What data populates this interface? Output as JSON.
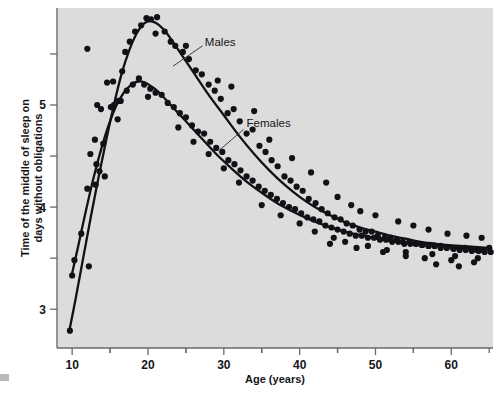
{
  "chart_data": {
    "type": "scatter",
    "title": "",
    "subtitle": "",
    "xlabel": "Age (years)",
    "ylabel": "Time of the middle of sleep on days without obligations",
    "xlim": [
      8,
      65.5
    ],
    "ylim": [
      2.62,
      5.95
    ],
    "grid": false,
    "legend_position": "inline-annotation",
    "x_ticks_major": [
      10,
      20,
      30,
      40,
      50,
      60
    ],
    "x_tick_labels": [
      "10",
      "20",
      "30",
      "40",
      "50",
      "60"
    ],
    "x_ticks_minor": [
      15,
      25,
      35,
      45,
      55,
      65
    ],
    "y_ticks_major": [
      3,
      4,
      5
    ],
    "y_tick_labels": [
      "3",
      "4",
      "5"
    ],
    "y_ticks_minor": [
      3.5,
      4.5,
      5.5
    ],
    "annotations": [
      {
        "text": "Males",
        "x": 27.5,
        "y": 5.62
      },
      {
        "text": "Females",
        "x": 33.0,
        "y": 4.82
      }
    ],
    "series": [
      {
        "name": "Males",
        "color": "#111216",
        "fit_curve": [
          [
            9.6,
            2.78
          ],
          [
            10.5,
            3.12
          ],
          [
            11.5,
            3.52
          ],
          [
            12.5,
            3.92
          ],
          [
            13.5,
            4.3
          ],
          [
            14.5,
            4.66
          ],
          [
            15.5,
            5.0
          ],
          [
            16.5,
            5.3
          ],
          [
            17.5,
            5.53
          ],
          [
            18.5,
            5.7
          ],
          [
            19.5,
            5.8
          ],
          [
            20.5,
            5.82
          ],
          [
            21.5,
            5.78
          ],
          [
            22.5,
            5.7
          ],
          [
            24.0,
            5.54
          ],
          [
            26.0,
            5.32
          ],
          [
            28.0,
            5.1
          ],
          [
            30.0,
            4.9
          ],
          [
            32.0,
            4.7
          ],
          [
            34.0,
            4.52
          ],
          [
            36.0,
            4.36
          ],
          [
            38.0,
            4.22
          ],
          [
            40.0,
            4.1
          ],
          [
            42.0,
            4.0
          ],
          [
            44.0,
            3.92
          ],
          [
            46.0,
            3.85
          ],
          [
            48.0,
            3.8
          ],
          [
            50.0,
            3.76
          ],
          [
            52.0,
            3.72
          ],
          [
            54.0,
            3.69
          ],
          [
            56.0,
            3.66
          ],
          [
            58.0,
            3.64
          ],
          [
            60.0,
            3.62
          ],
          [
            62.0,
            3.6
          ],
          [
            64.5,
            3.59
          ]
        ],
        "points": [
          [
            9.7,
            2.79
          ],
          [
            10.3,
            3.48
          ],
          [
            12.2,
            3.42
          ],
          [
            13.1,
            4.22
          ],
          [
            13.6,
            4.35
          ],
          [
            14.1,
            4.62
          ],
          [
            14.3,
            4.3
          ],
          [
            15.1,
            4.98
          ],
          [
            15.4,
            5.23
          ],
          [
            16.1,
            5.04
          ],
          [
            16.6,
            5.33
          ],
          [
            17.0,
            5.52
          ],
          [
            17.6,
            5.62
          ],
          [
            18.3,
            5.72
          ],
          [
            19.1,
            5.78
          ],
          [
            19.8,
            5.85
          ],
          [
            20.4,
            5.84
          ],
          [
            21.2,
            5.86
          ],
          [
            21.0,
            5.7
          ],
          [
            22.2,
            5.72
          ],
          [
            23.0,
            5.62
          ],
          [
            23.6,
            5.58
          ],
          [
            24.6,
            5.52
          ],
          [
            25.4,
            5.45
          ],
          [
            26.3,
            5.34
          ],
          [
            27.1,
            5.3
          ],
          [
            28.0,
            5.2
          ],
          [
            28.8,
            5.14
          ],
          [
            29.6,
            5.06
          ],
          [
            30.5,
            4.92
          ],
          [
            31.3,
            4.96
          ],
          [
            32.1,
            4.84
          ],
          [
            33.0,
            4.72
          ],
          [
            33.8,
            4.76
          ],
          [
            34.7,
            4.6
          ],
          [
            35.5,
            4.54
          ],
          [
            36.3,
            4.46
          ],
          [
            37.1,
            4.4
          ],
          [
            38.0,
            4.3
          ],
          [
            38.8,
            4.26
          ],
          [
            39.6,
            4.2
          ],
          [
            40.4,
            4.16
          ],
          [
            41.2,
            4.08
          ],
          [
            42.1,
            4.04
          ],
          [
            42.9,
            3.98
          ],
          [
            43.7,
            3.94
          ],
          [
            44.6,
            3.9
          ],
          [
            45.4,
            3.88
          ],
          [
            46.2,
            3.84
          ],
          [
            47.0,
            3.82
          ],
          [
            47.9,
            3.78
          ],
          [
            48.7,
            3.76
          ],
          [
            49.5,
            3.76
          ],
          [
            50.3,
            3.72
          ],
          [
            51.2,
            3.7
          ],
          [
            52.0,
            3.7
          ],
          [
            52.8,
            3.68
          ],
          [
            53.6,
            3.66
          ],
          [
            54.5,
            3.66
          ],
          [
            55.3,
            3.64
          ],
          [
            56.1,
            3.63
          ],
          [
            57.0,
            3.62
          ],
          [
            57.8,
            3.62
          ],
          [
            58.6,
            3.6
          ],
          [
            59.4,
            3.6
          ],
          [
            60.3,
            3.59
          ],
          [
            61.1,
            3.58
          ],
          [
            61.9,
            3.58
          ],
          [
            62.7,
            3.57
          ],
          [
            63.6,
            3.57
          ],
          [
            64.4,
            3.56
          ],
          [
            12.0,
            5.55
          ],
          [
            13.3,
            5.0
          ],
          [
            25.0,
            5.58
          ],
          [
            29.2,
            5.24
          ],
          [
            31.0,
            5.18
          ],
          [
            34.0,
            4.94
          ],
          [
            36.0,
            4.66
          ],
          [
            39.0,
            4.48
          ],
          [
            41.5,
            4.34
          ],
          [
            43.5,
            4.24
          ],
          [
            45.0,
            4.1
          ],
          [
            46.8,
            4.02
          ],
          [
            48.0,
            3.96
          ],
          [
            50.0,
            3.92
          ],
          [
            53.0,
            3.86
          ],
          [
            55.0,
            3.82
          ],
          [
            57.0,
            3.78
          ],
          [
            59.5,
            3.74
          ],
          [
            62.0,
            3.72
          ],
          [
            64.0,
            3.7
          ],
          [
            44.0,
            3.64
          ],
          [
            47.5,
            3.6
          ],
          [
            51.0,
            3.56
          ],
          [
            54.0,
            3.52
          ],
          [
            56.5,
            3.5
          ],
          [
            60.0,
            3.48
          ],
          [
            63.0,
            3.46
          ],
          [
            65.0,
            3.6
          ],
          [
            58.0,
            3.44
          ],
          [
            61.0,
            3.42
          ]
        ]
      },
      {
        "name": "Females",
        "color": "#111216",
        "fit_curve": [
          [
            9.9,
            3.32
          ],
          [
            10.8,
            3.62
          ],
          [
            11.8,
            3.96
          ],
          [
            12.8,
            4.28
          ],
          [
            13.8,
            4.56
          ],
          [
            14.8,
            4.8
          ],
          [
            15.8,
            4.99
          ],
          [
            16.8,
            5.12
          ],
          [
            17.8,
            5.2
          ],
          [
            18.7,
            5.23
          ],
          [
            19.6,
            5.22
          ],
          [
            20.5,
            5.18
          ],
          [
            21.5,
            5.12
          ],
          [
            23.0,
            5.0
          ],
          [
            25.0,
            4.84
          ],
          [
            27.0,
            4.68
          ],
          [
            29.0,
            4.52
          ],
          [
            31.0,
            4.38
          ],
          [
            33.0,
            4.25
          ],
          [
            35.0,
            4.14
          ],
          [
            37.0,
            4.04
          ],
          [
            39.0,
            3.96
          ],
          [
            41.0,
            3.89
          ],
          [
            43.0,
            3.83
          ],
          [
            45.0,
            3.78
          ],
          [
            47.0,
            3.74
          ],
          [
            49.0,
            3.71
          ],
          [
            51.0,
            3.68
          ],
          [
            53.0,
            3.66
          ],
          [
            55.0,
            3.65
          ],
          [
            57.0,
            3.64
          ],
          [
            59.0,
            3.63
          ],
          [
            61.0,
            3.62
          ],
          [
            63.0,
            3.61
          ],
          [
            64.8,
            3.6
          ]
        ],
        "points": [
          [
            10.0,
            3.33
          ],
          [
            11.2,
            3.74
          ],
          [
            12.4,
            4.52
          ],
          [
            13.0,
            4.66
          ],
          [
            13.8,
            4.96
          ],
          [
            14.6,
            5.22
          ],
          [
            15.5,
            5.0
          ],
          [
            16.4,
            5.04
          ],
          [
            17.2,
            5.14
          ],
          [
            18.0,
            5.2
          ],
          [
            18.8,
            5.26
          ],
          [
            19.5,
            5.2
          ],
          [
            20.3,
            5.16
          ],
          [
            21.0,
            5.12
          ],
          [
            21.8,
            5.1
          ],
          [
            22.6,
            5.02
          ],
          [
            23.4,
            4.98
          ],
          [
            24.2,
            4.92
          ],
          [
            25.0,
            4.88
          ],
          [
            25.8,
            4.8
          ],
          [
            26.6,
            4.74
          ],
          [
            27.4,
            4.72
          ],
          [
            28.2,
            4.64
          ],
          [
            29.0,
            4.58
          ],
          [
            29.8,
            4.54
          ],
          [
            30.6,
            4.46
          ],
          [
            31.4,
            4.42
          ],
          [
            32.2,
            4.36
          ],
          [
            33.0,
            4.3
          ],
          [
            33.8,
            4.26
          ],
          [
            34.6,
            4.2
          ],
          [
            35.4,
            4.16
          ],
          [
            36.2,
            4.12
          ],
          [
            37.0,
            4.08
          ],
          [
            37.8,
            4.04
          ],
          [
            38.6,
            4.0
          ],
          [
            39.4,
            3.98
          ],
          [
            40.2,
            3.94
          ],
          [
            41.0,
            3.9
          ],
          [
            41.8,
            3.88
          ],
          [
            42.6,
            3.86
          ],
          [
            43.4,
            3.82
          ],
          [
            44.2,
            3.8
          ],
          [
            45.0,
            3.78
          ],
          [
            45.8,
            3.76
          ],
          [
            46.6,
            3.74
          ],
          [
            47.4,
            3.72
          ],
          [
            48.2,
            3.72
          ],
          [
            49.0,
            3.7
          ],
          [
            49.8,
            3.7
          ],
          [
            50.6,
            3.68
          ],
          [
            51.4,
            3.68
          ],
          [
            52.2,
            3.66
          ],
          [
            53.0,
            3.66
          ],
          [
            53.8,
            3.64
          ],
          [
            54.6,
            3.64
          ],
          [
            55.4,
            3.64
          ],
          [
            56.2,
            3.63
          ],
          [
            57.0,
            3.62
          ],
          [
            57.8,
            3.62
          ],
          [
            58.6,
            3.62
          ],
          [
            59.4,
            3.61
          ],
          [
            60.2,
            3.6
          ],
          [
            61.0,
            3.6
          ],
          [
            61.8,
            3.6
          ],
          [
            62.6,
            3.59
          ],
          [
            63.4,
            3.58
          ],
          [
            64.2,
            3.58
          ],
          [
            12.0,
            4.18
          ],
          [
            13.2,
            4.42
          ],
          [
            16.0,
            4.86
          ],
          [
            20.0,
            5.08
          ],
          [
            24.0,
            4.78
          ],
          [
            26.0,
            4.64
          ],
          [
            28.0,
            4.52
          ],
          [
            30.0,
            4.38
          ],
          [
            32.0,
            4.24
          ],
          [
            35.0,
            4.02
          ],
          [
            37.5,
            3.92
          ],
          [
            40.0,
            3.84
          ],
          [
            42.0,
            3.76
          ],
          [
            44.5,
            3.7
          ],
          [
            46.0,
            3.66
          ],
          [
            49.0,
            3.62
          ],
          [
            51.5,
            3.58
          ],
          [
            54.0,
            3.56
          ],
          [
            57.5,
            3.54
          ],
          [
            60.5,
            3.52
          ],
          [
            63.5,
            3.5
          ],
          [
            65.2,
            3.56
          ]
        ]
      }
    ]
  },
  "footer_mark": {
    "visible": true
  }
}
